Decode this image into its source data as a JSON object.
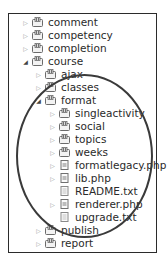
{
  "tree": {
    "items": [
      {
        "label": "comment",
        "type": "package",
        "level": 0,
        "state": "collapsed"
      },
      {
        "label": "competency",
        "type": "package",
        "level": 0,
        "state": "collapsed"
      },
      {
        "label": "completion",
        "type": "package",
        "level": 0,
        "state": "collapsed"
      },
      {
        "label": "course",
        "type": "package",
        "level": 0,
        "state": "expanded"
      },
      {
        "label": "ajax",
        "type": "package",
        "level": 1,
        "state": "collapsed"
      },
      {
        "label": "classes",
        "type": "package",
        "level": 1,
        "state": "collapsed"
      },
      {
        "label": "format",
        "type": "package",
        "level": 1,
        "state": "expanded"
      },
      {
        "label": "singleactivity",
        "type": "package",
        "level": 2,
        "state": "collapsed"
      },
      {
        "label": "social",
        "type": "package",
        "level": 2,
        "state": "collapsed"
      },
      {
        "label": "topics",
        "type": "package",
        "level": 2,
        "state": "collapsed"
      },
      {
        "label": "weeks",
        "type": "package",
        "level": 2,
        "state": "collapsed"
      },
      {
        "label": "formatlegacy.php",
        "type": "php-file",
        "level": 2,
        "state": "collapsed"
      },
      {
        "label": "lib.php",
        "type": "php-file",
        "level": 2,
        "state": "collapsed"
      },
      {
        "label": "README.txt",
        "type": "text-file",
        "level": 2,
        "state": "leaf"
      },
      {
        "label": "renderer.php",
        "type": "php-file",
        "level": 2,
        "state": "collapsed"
      },
      {
        "label": "upgrade.txt",
        "type": "text-file",
        "level": 2,
        "state": "leaf"
      },
      {
        "label": "publish",
        "type": "package",
        "level": 1,
        "state": "collapsed"
      },
      {
        "label": "report",
        "type": "package",
        "level": 1,
        "state": "collapsed"
      }
    ]
  },
  "annotation": {
    "shape": "ellipse",
    "color": "#3a3a3a",
    "highlights": "format"
  },
  "colors": {
    "border": "#2b2b2b",
    "text": "#2a2a2a",
    "arrow": "#9a9a9a"
  }
}
